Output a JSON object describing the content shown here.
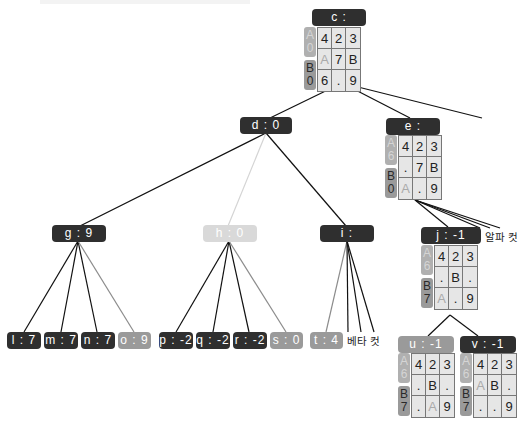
{
  "colors": {
    "dark": "#2f2f2f",
    "mid": "#9a9a9a",
    "light": "#d9d9d9",
    "edge_dark": "#111111",
    "edge_gray": "#8c8c8c",
    "edge_light": "#d4d4d4"
  },
  "nodes": {
    "c": {
      "label": "c :",
      "board": {
        "side_a": "A\n0",
        "side_b": "B\n0",
        "cells": [
          "4",
          "2",
          "3",
          "A",
          "7",
          "B",
          "6",
          ".",
          "9"
        ],
        "faint": [
          3
        ]
      }
    },
    "d": {
      "label": "d : 0"
    },
    "e": {
      "label": "e :",
      "board": {
        "side_a": "A\n6",
        "side_b": "B\n0",
        "cells": [
          "4",
          "2",
          "3",
          ".",
          "7",
          "B",
          "A",
          ".",
          "9"
        ],
        "faint": [
          6
        ]
      }
    },
    "g": {
      "label": "g : 9"
    },
    "h": {
      "label": "h : 0"
    },
    "i": {
      "label": "i :"
    },
    "j": {
      "label": "j : -1",
      "board": {
        "side_a": "A\n6",
        "side_b": "B\n7",
        "cells": [
          "4",
          "2",
          "3",
          ".",
          "B",
          ".",
          "A",
          ".",
          "9"
        ],
        "faint": [
          6
        ]
      }
    },
    "l": {
      "label": "l : 7"
    },
    "m": {
      "label": "m : 7"
    },
    "n": {
      "label": "n : 7"
    },
    "o": {
      "label": "o : 9"
    },
    "p": {
      "label": "p : -2"
    },
    "q": {
      "label": "q : -2"
    },
    "r": {
      "label": "r : -2"
    },
    "s": {
      "label": "s : 0"
    },
    "t": {
      "label": "t : 4"
    },
    "u": {
      "label": "u : -1",
      "board": {
        "side_a": "A\n6",
        "side_b": "B\n7",
        "cells": [
          "4",
          "2",
          "3",
          ".",
          "B",
          ".",
          ".",
          "A",
          "9"
        ],
        "faint": [
          7
        ]
      }
    },
    "v": {
      "label": "v : -1",
      "board": {
        "side_a": "A\n6",
        "side_b": "B\n7",
        "cells": [
          "4",
          "2",
          "3",
          "A",
          "B",
          ".",
          ".",
          ".",
          "9"
        ],
        "faint": [
          3
        ]
      }
    }
  },
  "annotations": {
    "beta_cut": "베타 컷",
    "alpha_cut": "알파 컷"
  }
}
